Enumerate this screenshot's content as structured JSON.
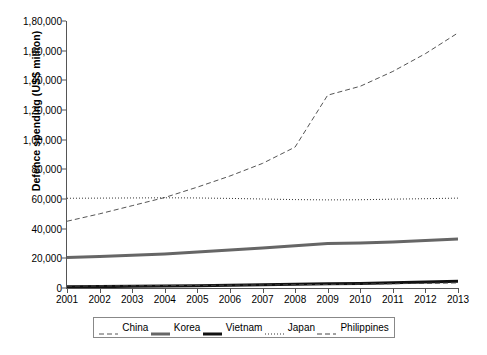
{
  "chart_data": {
    "type": "line",
    "title": "",
    "xlabel": "",
    "ylabel": "Defence spending (US$ million)",
    "x": [
      2001,
      2002,
      2003,
      2004,
      2005,
      2006,
      2007,
      2008,
      2009,
      2010,
      2011,
      2012,
      2013
    ],
    "xtick_labels": [
      "2001",
      "2002",
      "2003",
      "2004",
      "2005",
      "2006",
      "2007",
      "2008",
      "2009",
      "2010",
      "2011",
      "2012",
      "2013"
    ],
    "ytick_labels": [
      "0",
      "20,000",
      "40,000",
      "60,000",
      "80,000",
      "1,00,000",
      "1,20,000",
      "1,40,000",
      "1,60,000",
      "1,80,000"
    ],
    "ytick_values": [
      0,
      20000,
      40000,
      60000,
      80000,
      100000,
      120000,
      140000,
      160000,
      180000
    ],
    "ylim": [
      0,
      180000
    ],
    "xlim": [
      2001,
      2013
    ],
    "grid": false,
    "legend_position": "below-plot",
    "series": [
      {
        "name": "China",
        "style": "dashed",
        "color": "#555555",
        "width": 1,
        "values": [
          45000,
          50000,
          55500,
          61000,
          68000,
          75500,
          84000,
          95000,
          130000,
          136000,
          146000,
          158000,
          172000
        ]
      },
      {
        "name": "Korea",
        "style": "solid",
        "color": "#666666",
        "width": 3,
        "values": [
          20500,
          21200,
          22000,
          23000,
          24200,
          25600,
          27000,
          28400,
          30000,
          30300,
          31000,
          32000,
          33000
        ]
      },
      {
        "name": "Vietnam",
        "style": "solid",
        "color": "#111111",
        "width": 3,
        "values": [
          800,
          950,
          1100,
          1300,
          1550,
          1850,
          2150,
          2500,
          2800,
          3100,
          3500,
          4000,
          4500
        ]
      },
      {
        "name": "Japan",
        "style": "dotted",
        "color": "#333333",
        "width": 1,
        "values": [
          60500,
          60600,
          60700,
          60800,
          60700,
          60400,
          60000,
          59600,
          59400,
          59500,
          59900,
          60200,
          60600
        ]
      },
      {
        "name": "Philippines",
        "style": "dashed",
        "color": "#444444",
        "width": 1,
        "values": [
          1300,
          1400,
          1500,
          1600,
          1750,
          1900,
          2050,
          2250,
          2450,
          2650,
          2900,
          3150,
          3450
        ]
      }
    ]
  }
}
